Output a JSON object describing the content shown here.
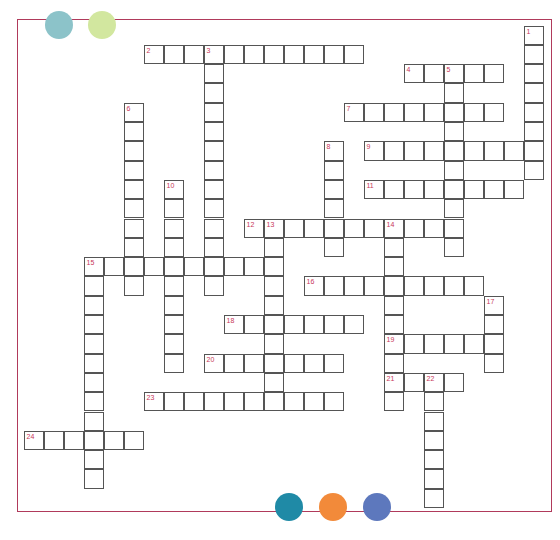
{
  "puzzle": {
    "type": "crossword",
    "frame_color": "#b03a5b",
    "cell_pitch_x": 20,
    "cell_pitch_y": 19.3,
    "origin_x": 24,
    "origin_y": 26
  },
  "decorations": {
    "top_dots": [
      {
        "name": "teal-dot",
        "color": "#8cc3c9",
        "cx": 59,
        "cy": 25,
        "r": 14
      },
      {
        "name": "lime-dot",
        "color": "#d2e79f",
        "cx": 102,
        "cy": 25,
        "r": 14
      }
    ],
    "bottom_dots": [
      {
        "name": "dark-teal-dot",
        "color": "#1f8aa6",
        "cx": 289,
        "cy": 507,
        "r": 14
      },
      {
        "name": "orange-dot",
        "color": "#f28a3a",
        "cx": 333,
        "cy": 507,
        "r": 14
      },
      {
        "name": "blue-dot",
        "color": "#5d78bd",
        "cx": 377,
        "cy": 507,
        "r": 14
      }
    ]
  },
  "entries": [
    {
      "number": "1",
      "direction": "down",
      "row": 0,
      "col": 25,
      "length": 8
    },
    {
      "number": "2",
      "direction": "across",
      "row": 1,
      "col": 6,
      "length": 11
    },
    {
      "number": "3",
      "direction": "down",
      "row": 1,
      "col": 9,
      "length": 13
    },
    {
      "number": "4",
      "direction": "across",
      "row": 2,
      "col": 19,
      "length": 5
    },
    {
      "number": "5",
      "direction": "down",
      "row": 2,
      "col": 21,
      "length": 10
    },
    {
      "number": "6",
      "direction": "down",
      "row": 4,
      "col": 5,
      "length": 10
    },
    {
      "number": "7",
      "direction": "across",
      "row": 4,
      "col": 16,
      "length": 8
    },
    {
      "number": "8",
      "direction": "down",
      "row": 6,
      "col": 15,
      "length": 6
    },
    {
      "number": "9",
      "direction": "across",
      "row": 6,
      "col": 17,
      "length": 9
    },
    {
      "number": "10",
      "direction": "down",
      "row": 8,
      "col": 7,
      "length": 10
    },
    {
      "number": "11",
      "direction": "across",
      "row": 8,
      "col": 17,
      "length": 8
    },
    {
      "number": "12",
      "direction": "across",
      "row": 10,
      "col": 11,
      "length": 11
    },
    {
      "number": "13",
      "direction": "down",
      "row": 10,
      "col": 12,
      "length": 10
    },
    {
      "number": "14",
      "direction": "down",
      "row": 10,
      "col": 18,
      "length": 10
    },
    {
      "number": "15",
      "direction": "across",
      "row": 12,
      "col": 3,
      "length": 10
    },
    {
      "number": "15",
      "direction": "down",
      "row": 12,
      "col": 3,
      "length": 12
    },
    {
      "number": "16",
      "direction": "across",
      "row": 13,
      "col": 14,
      "length": 9
    },
    {
      "number": "17",
      "direction": "down",
      "row": 14,
      "col": 23,
      "length": 4
    },
    {
      "number": "18",
      "direction": "across",
      "row": 15,
      "col": 10,
      "length": 7
    },
    {
      "number": "19",
      "direction": "across",
      "row": 16,
      "col": 18,
      "length": 6
    },
    {
      "number": "20",
      "direction": "across",
      "row": 17,
      "col": 9,
      "length": 7
    },
    {
      "number": "21",
      "direction": "across",
      "row": 18,
      "col": 18,
      "length": 4
    },
    {
      "number": "22",
      "direction": "down",
      "row": 18,
      "col": 20,
      "length": 7
    },
    {
      "number": "23",
      "direction": "across",
      "row": 19,
      "col": 6,
      "length": 10
    },
    {
      "number": "24",
      "direction": "across",
      "row": 21,
      "col": 0,
      "length": 6
    }
  ]
}
